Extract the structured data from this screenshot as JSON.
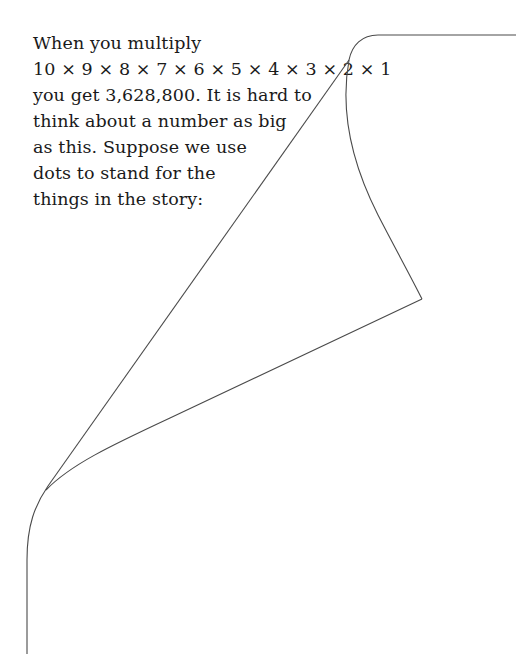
{
  "text": {
    "lines": [
      "When you multiply",
      "10 × 9 × 8 × 7 × 6 × 5 × 4 × 3 × 2 × 1",
      "you get 3,628,800. It is hard to",
      "think about a number as big",
      "as this. Suppose we use",
      "dots to stand for the",
      "things in the story:"
    ]
  },
  "illustration": {
    "description": "page-curl line drawing",
    "stroke_color": "#4a4a4a"
  }
}
